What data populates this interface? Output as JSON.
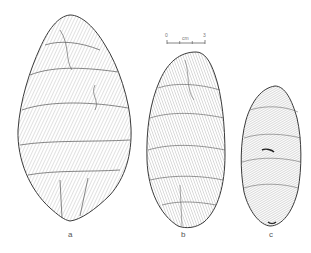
{
  "figure": {
    "scale_bar": {
      "start_label": "0",
      "unit_label": "cm",
      "end_label": "3"
    },
    "artifacts": [
      {
        "label": "a",
        "shape": "large ovate biface"
      },
      {
        "label": "b",
        "shape": "medium leaf-shaped biface"
      },
      {
        "label": "c",
        "shape": "small narrow leaf-shaped biface"
      }
    ],
    "colors": {
      "background": "#ffffff",
      "line": "#3a3a3a",
      "shade": "#8a8a8a"
    }
  }
}
